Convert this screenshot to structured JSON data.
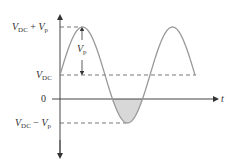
{
  "diagram": {
    "labels": {
      "peak": {
        "v": "V",
        "sub1": "DC",
        "op": " + ",
        "v2": "V",
        "sub2": "p"
      },
      "dc": {
        "v": "V",
        "sub": "DC"
      },
      "zero": "0",
      "trough": {
        "v": "V",
        "sub1": "DC",
        "op": " − ",
        "v2": "V",
        "sub2": "p"
      },
      "amplitude": {
        "v": "V",
        "sub": "p"
      },
      "time_axis": "t"
    },
    "colors": {
      "wave": "#999999",
      "axis": "#444444",
      "shade": "#d8d8d8",
      "dash": "#555555"
    },
    "wave": {
      "x_start": 60,
      "x_end": 195,
      "period_px": 90,
      "center_y": 75,
      "amplitude_px": 48,
      "zero_y": 99
    }
  }
}
